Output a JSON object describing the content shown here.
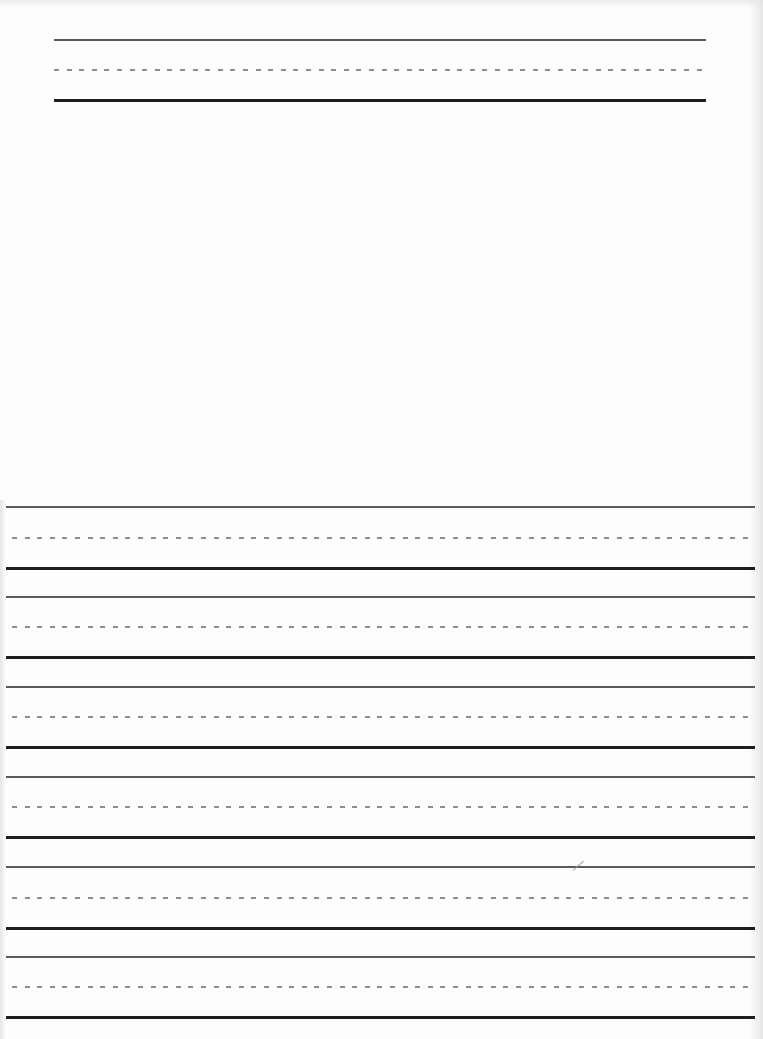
{
  "document": {
    "type": "handwriting practice worksheet",
    "background_color": "#ffffff",
    "line_colors": {
      "top_line": "#5a5a5a",
      "midline_dashed": "#8e8e8e",
      "baseline": "#1e1e1e"
    },
    "header_line_set": {
      "left": 54,
      "width": 652,
      "top_line_y": 40,
      "midline_y": 70,
      "baseline_y": 100
    },
    "drawing_area": {
      "description": "blank space for a picture",
      "top": 104,
      "height": 400
    },
    "writing_line_sets": [
      {
        "index": 1,
        "top_line_y": 507,
        "midline_y": 538,
        "baseline_y": 567
      },
      {
        "index": 2,
        "top_line_y": 597,
        "midline_y": 627,
        "baseline_y": 657
      },
      {
        "index": 3,
        "top_line_y": 687,
        "midline_y": 717,
        "baseline_y": 747
      },
      {
        "index": 4,
        "top_line_y": 777,
        "midline_y": 807,
        "baseline_y": 837
      },
      {
        "index": 5,
        "top_line_y": 867,
        "midline_y": 898,
        "baseline_y": 927
      },
      {
        "index": 6,
        "top_line_y": 957,
        "midline_y": 987,
        "baseline_y": 1017
      }
    ]
  }
}
